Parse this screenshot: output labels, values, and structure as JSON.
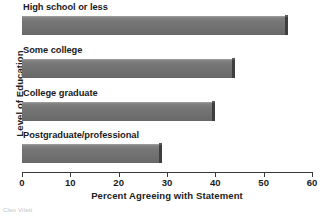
{
  "chart_data": {
    "type": "bar",
    "orientation": "horizontal",
    "title": "",
    "xlabel": "Percent Agreeing with Statement",
    "ylabel": "Level of Education",
    "categories": [
      "High school or less",
      "Some college",
      "College graduate",
      "Postgraduate/professional"
    ],
    "values": [
      55,
      44,
      40,
      29
    ],
    "series": [
      {
        "name": "Percent Agreeing with Statement",
        "values": [
          55,
          44,
          40,
          29
        ]
      }
    ],
    "xlim": [
      0,
      60
    ],
    "xticks": [
      0,
      10,
      20,
      30,
      40,
      50,
      60
    ],
    "xtick_labels": [
      "0",
      "10",
      "20",
      "30",
      "40",
      "50",
      "60"
    ],
    "grid": false,
    "legend": false,
    "bar_color": "#6f6f6f",
    "bar_edge_color": "#3e3e3e",
    "axis_color": "#3a3a3a",
    "background": "#ffffff"
  },
  "credit": {
    "text": "Cleo Vilett"
  }
}
